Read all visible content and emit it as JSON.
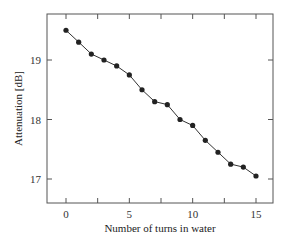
{
  "chart_data": {
    "type": "line",
    "title": "",
    "xlabel": "Number of turns in water",
    "ylabel": "Attenuation [dB]",
    "xlim": [
      -1.2,
      16.4
    ],
    "ylim": [
      16.6,
      19.8
    ],
    "xticks": [
      0,
      5,
      10,
      15
    ],
    "xticks_minor": [
      0,
      2.5,
      5,
      7.5,
      10,
      12.5,
      15
    ],
    "yticks": [
      17,
      18,
      19
    ],
    "grid": false,
    "legend": null,
    "marker": "filled-circle",
    "color": "#222222",
    "x": [
      0,
      1,
      2,
      3,
      4,
      5,
      6,
      7,
      8,
      9,
      10,
      11,
      12,
      13,
      14,
      15
    ],
    "series": [
      {
        "name": "Attenuation",
        "values": [
          19.5,
          19.3,
          19.1,
          19.0,
          18.9,
          18.75,
          18.5,
          18.3,
          18.25,
          18.0,
          17.9,
          17.65,
          17.45,
          17.25,
          17.2,
          17.05
        ]
      }
    ]
  }
}
